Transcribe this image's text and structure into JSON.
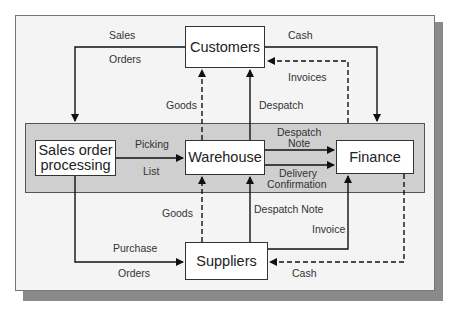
{
  "diagram": {
    "type": "data-flow",
    "nodes": {
      "customers": "Customers",
      "sales_order_processing": "Sales order processing",
      "warehouse": "Warehouse",
      "finance": "Finance",
      "suppliers": "Suppliers"
    },
    "flows": [
      {
        "from": "customers",
        "to": "sales_order_processing",
        "label_top": "Sales",
        "label_bottom": "Orders",
        "style": "solid"
      },
      {
        "from": "customers",
        "to": "finance",
        "label": "Cash",
        "style": "solid"
      },
      {
        "from": "finance",
        "to": "customers",
        "label": "Invoices",
        "style": "dashed"
      },
      {
        "from": "warehouse",
        "to": "customers",
        "label": "Goods",
        "style": "dashed"
      },
      {
        "from": "warehouse",
        "to": "customers",
        "label": "Despatch",
        "style": "solid"
      },
      {
        "from": "sales_order_processing",
        "to": "warehouse",
        "label_top": "Picking",
        "label_bottom": "List",
        "style": "solid"
      },
      {
        "from": "warehouse",
        "to": "finance",
        "label": "Despatch Note",
        "style": "solid"
      },
      {
        "from": "warehouse",
        "to": "finance",
        "label": "Delivery Confirmation",
        "style": "solid"
      },
      {
        "from": "suppliers",
        "to": "warehouse",
        "label": "Goods",
        "style": "dashed"
      },
      {
        "from": "suppliers",
        "to": "warehouse",
        "label": "Despatch Note",
        "style": "solid"
      },
      {
        "from": "suppliers",
        "to": "finance",
        "label": "Invoice",
        "style": "solid"
      },
      {
        "from": "finance",
        "to": "suppliers",
        "label": "Cash",
        "style": "dashed"
      },
      {
        "from": "sales_order_processing",
        "to": "suppliers",
        "label_top": "Purchase",
        "label_bottom": "Orders",
        "style": "solid"
      }
    ],
    "labels": {
      "sales": "Sales",
      "orders_top": "Orders",
      "cash_top": "Cash",
      "invoices": "Invoices",
      "goods_top": "Goods",
      "despatch": "Despatch",
      "picking": "Picking",
      "list": "List",
      "despatch_note_1": "Despatch",
      "despatch_note_2": "Note",
      "delivery_1": "Delivery",
      "delivery_2": "Confirmation",
      "goods_bottom": "Goods",
      "despatch_note_bottom": "Despatch Note",
      "invoice": "Invoice",
      "purchase": "Purchase",
      "orders_bottom": "Orders",
      "cash_bottom": "Cash"
    },
    "colors": {
      "frame_bg": "#f4f4f4",
      "band_bg": "#cfcfcf",
      "shadow": "#8a8a8a",
      "line": "#111111"
    }
  }
}
